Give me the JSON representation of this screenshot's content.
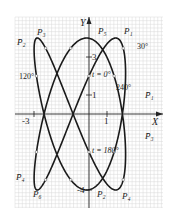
{
  "figure": {
    "axes": {
      "x_label": "X",
      "y_label": "Y"
    },
    "ticks": {
      "x": [
        "-3",
        "1"
      ],
      "y": [
        "3",
        "1",
        "-4"
      ]
    },
    "param_labels": {
      "t0": "t = 0°",
      "t180": "t = 180°",
      "a30": "30°",
      "a120": "120°",
      "a240": "240°"
    },
    "points": {
      "P1": "P₁",
      "P2": "P₂",
      "P3": "P₃",
      "P4": "P₄",
      "P5": "P₅",
      "P6": "P₆",
      "P1bar": "P̄₁",
      "P2bar": "P̄₂",
      "P3bar": "P̄₃",
      "P4bar": "P̄₄"
    },
    "colors": {
      "grid": "#d8d8d8",
      "curve": "#1a1a1a",
      "axis": "#222222",
      "background": "#ffffff"
    }
  },
  "chart_data": {
    "type": "line",
    "title": "",
    "xlabel": "X",
    "ylabel": "Y",
    "xlim": [
      -3.5,
      2.5
    ],
    "ylim": [
      -4.9,
      5.1
    ],
    "grid": true,
    "parametric": "X = -0.5 + 2.5 sin(2t + 11.5°), Y = 4 sin(3t + 30°)",
    "annotations": [
      "t=0°",
      "t=180°",
      "30°",
      "120°",
      "240°",
      "P1",
      "P2",
      "P3",
      "P4",
      "P5",
      "P6",
      "P̄1",
      "P̄2",
      "P̄3",
      "P̄4"
    ]
  }
}
